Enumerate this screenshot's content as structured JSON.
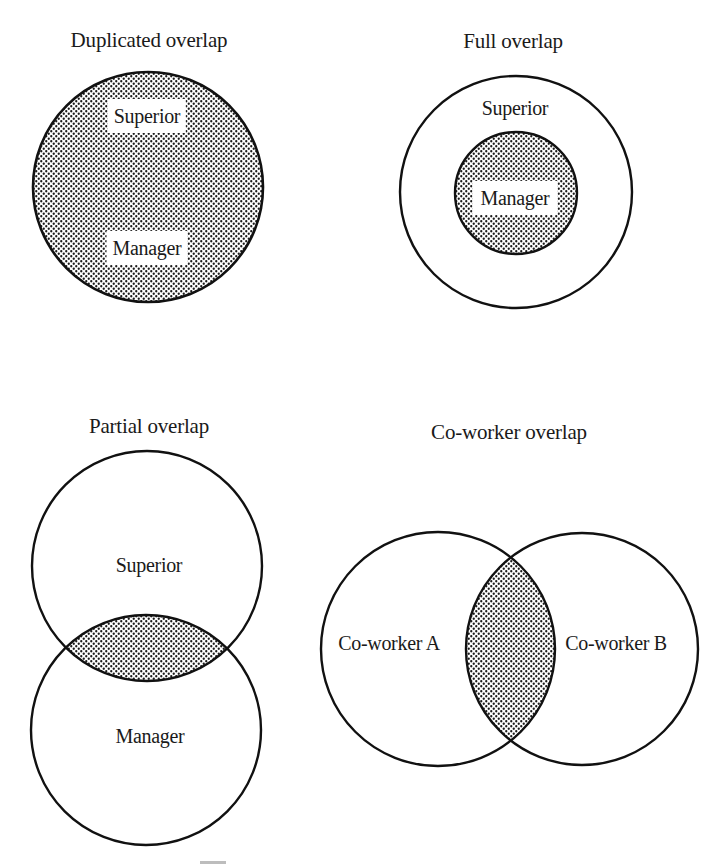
{
  "figure": {
    "panels": [
      {
        "id": "duplicated",
        "title": "Duplicated overlap",
        "labels": [
          "Superior",
          "Manager"
        ],
        "description": "Superior and manager roles coincide completely; single fully shaded circle"
      },
      {
        "id": "full",
        "title": "Full overlap",
        "labels": [
          "Superior",
          "Manager"
        ],
        "description": "Manager circle shaded, nested entirely inside larger Superior circle"
      },
      {
        "id": "partial",
        "title": "Partial overlap",
        "labels": [
          "Superior",
          "Manager"
        ],
        "description": "Two vertically stacked circles; shaded lens where they intersect"
      },
      {
        "id": "coworker",
        "title": "Co-worker overlap",
        "labels": [
          "Co-worker A",
          "Co-worker B"
        ],
        "description": "Two side-by-side circles; shaded lens where they intersect"
      }
    ],
    "colors": {
      "stroke": "#111111",
      "dot": "#1a1a1a",
      "background": "#ffffff"
    }
  }
}
